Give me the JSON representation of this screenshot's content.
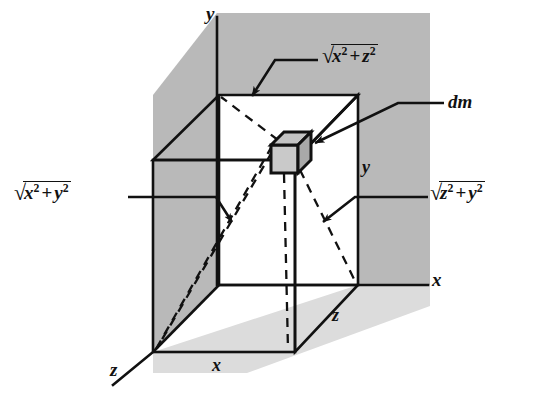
{
  "figure": {
    "type": "technical-line-diagram",
    "background_color": "#ffffff",
    "wall_shade_color": "#b8b8b8",
    "floor_shade_color": "#d8d8d8",
    "line_color": "#111111",
    "dm_cube_face_color": "#b0b0b0"
  },
  "axes": [
    {
      "name": "y-axis",
      "label": "y",
      "direction": "up",
      "label_x": 210,
      "label_y": 8
    },
    {
      "name": "x-axis",
      "label": "x",
      "direction": "right",
      "label_x": 432,
      "label_y": 272
    },
    {
      "name": "z-axis",
      "label": "z",
      "direction": "down-left",
      "label_x": 112,
      "label_y": 362
    }
  ],
  "dimensions": [
    {
      "name": "x-dimension",
      "label": "x",
      "edge": "bottom-front",
      "label_x": 212,
      "label_y": 355
    },
    {
      "name": "z-dimension",
      "label": "z",
      "edge": "bottom-right-receding",
      "label_x": 333,
      "label_y": 308
    },
    {
      "name": "y-dimension",
      "label": "y",
      "edge": "right-vertical",
      "label_x": 362,
      "label_y": 160
    }
  ],
  "callouts": [
    {
      "name": "radius-xz",
      "expression": "sqrt(x^2 + z^2)",
      "parts": {
        "rad": "√",
        "first": "x",
        "first_exp": "2",
        "plus": "+",
        "second": "z",
        "second_exp": "2"
      },
      "label_x": 322,
      "label_y": 48,
      "points_to": "diagonal from top-back-left corner toward dm"
    },
    {
      "name": "mass-element",
      "expression": "dm",
      "label_x": 448,
      "label_y": 95,
      "points_to": "small cube element at interior point"
    },
    {
      "name": "radius-xy",
      "expression": "sqrt(x^2 + y^2)",
      "parts": {
        "rad": "√",
        "first": "x",
        "first_exp": "2",
        "plus": "+",
        "second": "y",
        "second_exp": "2"
      },
      "label_x": 12,
      "label_y": 185,
      "points_to": "diagonal from front-bottom-left corner toward dm"
    },
    {
      "name": "radius-zy",
      "expression": "sqrt(z^2 + y^2)",
      "parts": {
        "rad": "√",
        "first": "z",
        "first_exp": "2",
        "plus": "+",
        "second": "y",
        "second_exp": "2"
      },
      "label_x": 432,
      "label_y": 185,
      "points_to": "diagonal from bottom-right-back corner toward dm"
    }
  ],
  "geometry": {
    "origin": {
      "x": 358,
      "y": 285
    },
    "block_corners": {
      "front_top_left": {
        "x": 153,
        "y": 160
      },
      "front_top_right": {
        "x": 295,
        "y": 160
      },
      "front_bottom_left": {
        "x": 153,
        "y": 352
      },
      "front_bottom_right": {
        "x": 295,
        "y": 352
      },
      "back_top_left": {
        "x": 219,
        "y": 95
      },
      "back_top_right": {
        "x": 358,
        "y": 95
      },
      "back_bottom_left": {
        "x": 219,
        "y": 285
      },
      "back_bottom_right": {
        "x": 358,
        "y": 285
      }
    },
    "dm_cube": {
      "x": 271,
      "y": 132,
      "w": 40,
      "h": 41
    }
  }
}
